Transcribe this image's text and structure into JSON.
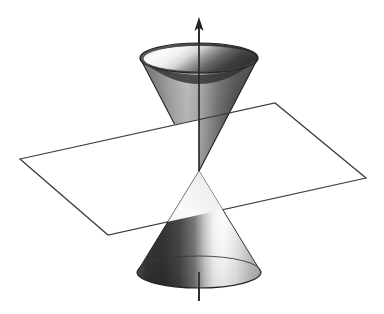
{
  "figure": {
    "title": "",
    "kind": "double-cone-intersected-by-plane",
    "background_color": "#ffffff",
    "ink_color": "#1a1a1a"
  },
  "artifacts": {
    "top_smudge": "",
    "bottom_smudge": ""
  },
  "axis": {
    "name": "vertical-axis",
    "label": "",
    "color": "#2a2a2a",
    "x": 199,
    "top_y": 18,
    "bottom_y": 301,
    "arrowhead_y": 18,
    "stroke_width": 1.6
  },
  "upper_cone": {
    "name": "upper-nappe",
    "orientation": "inverted",
    "apex": {
      "x": 199,
      "y": 171
    },
    "rim_center": {
      "x": 199,
      "y": 58
    },
    "rim_radius_x": 59,
    "rim_radius_y": 15,
    "outer_light": "#efefef",
    "outer_dark": "#3a3a3a",
    "inner_light": "#fcfcfc",
    "inner_dark": "#2e2e2e",
    "rim_band_color": "#404040"
  },
  "lower_cone": {
    "name": "lower-nappe",
    "orientation": "upright",
    "apex": {
      "x": 199,
      "y": 171
    },
    "base_center": {
      "x": 199,
      "y": 272
    },
    "base_radius_x": 62,
    "base_radius_y": 16,
    "outer_light": "#fdfdfd",
    "outer_dark": "#262626",
    "base_edge_color": "#2a2a2a"
  },
  "plane": {
    "name": "cutting-plane",
    "fill": "#ffffff",
    "edge_color": "#3c3c3c",
    "stroke_width": 1.3,
    "vertices": [
      {
        "label": "left",
        "x": 20,
        "y": 159
      },
      {
        "label": "top",
        "x": 275,
        "y": 103
      },
      {
        "label": "right",
        "x": 366,
        "y": 178
      },
      {
        "label": "bottom",
        "x": 108,
        "y": 235
      }
    ]
  },
  "intersection": {
    "name": "plane-cone-intersection",
    "description": "",
    "visible_curve_color": "#3c3c3c"
  }
}
